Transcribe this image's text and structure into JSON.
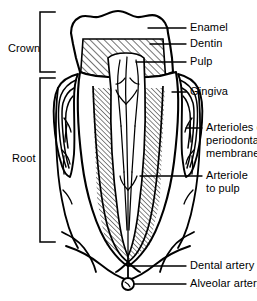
{
  "diagram": {
    "background_color": "#ffffff",
    "line_color": "#000000",
    "regions": {
      "crown_label": "Crown",
      "root_label": "Root"
    },
    "labels": {
      "enamel": "Enamel",
      "dentin": "Dentin",
      "pulp": "Pulp",
      "gingiva": "Gingiva",
      "arterioles_line1": "Arterioles of",
      "arterioles_line2": "periodontal",
      "arterioles_line3": "membrane",
      "arteriole_pulp_line1": "Arteriole",
      "arteriole_pulp_line2": "to pulp",
      "dental_artery": "Dental artery",
      "alveolar_artery": "Alveolar artery"
    }
  }
}
